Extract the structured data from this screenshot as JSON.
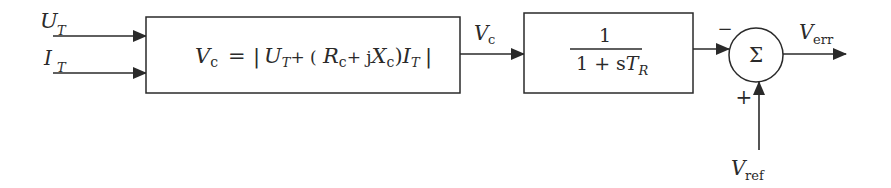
{
  "diagram": {
    "type": "block-diagram",
    "inputs": [
      {
        "symbol": "U",
        "subscript": "T",
        "label": "U_T"
      },
      {
        "symbol": "I",
        "subscript": "T",
        "label": "I_T"
      }
    ],
    "block1": {
      "lhs": "V",
      "lhs_sub": "c",
      "equals": "=",
      "abs_open": "|",
      "term1": "U",
      "term1_sub": "T",
      "plus1": "+ (",
      "R": "R",
      "R_sub": "c",
      "plus2": "+ j",
      "X": "X",
      "X_sub": "c",
      "close": ")",
      "I": "I",
      "I_sub": "T",
      "abs_close": "|",
      "formula_text": "Vc = |U_T + (Rc + jXc) I_T|"
    },
    "signal_vc": {
      "symbol": "V",
      "subscript": "c"
    },
    "block2": {
      "numerator": "1",
      "denominator": "1 + s",
      "den_T": "T",
      "den_sub": "R",
      "formula_text": "1 / (1 + sT_R)"
    },
    "summer": {
      "symbol": "Σ",
      "sign_top": "−",
      "sign_bottom": "+"
    },
    "output": {
      "symbol": "V",
      "subscript": "err"
    },
    "reference": {
      "symbol": "V",
      "subscript": "ref"
    }
  }
}
